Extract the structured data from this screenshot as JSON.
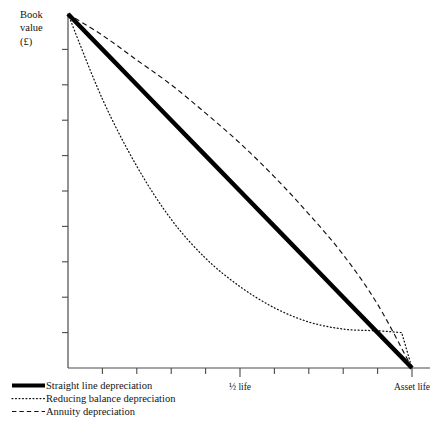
{
  "chart_data": {
    "type": "line",
    "title": "",
    "ylabel": "Book value (£)",
    "ylabel_lines": [
      "Book",
      "value",
      "(£)"
    ],
    "xlabel": "",
    "xlim": [
      0,
      1
    ],
    "ylim": [
      0,
      1
    ],
    "grid": false,
    "legend_position": "below-axes-left",
    "x_tick_count": 10,
    "y_tick_count": 9,
    "x_tick_labels": [
      {
        "x": 0.5,
        "label": "½ life"
      },
      {
        "x": 1.0,
        "label": "Asset life"
      }
    ],
    "y_tick_labels": [],
    "series": [
      {
        "name": "Straight line depreciation",
        "style": "solid-thick",
        "x": [
          0,
          0.1,
          0.2,
          0.3,
          0.4,
          0.5,
          0.6,
          0.7,
          0.8,
          0.9,
          1.0
        ],
        "values": [
          1.0,
          0.9,
          0.8,
          0.7,
          0.6,
          0.5,
          0.4,
          0.3,
          0.2,
          0.1,
          0.0
        ]
      },
      {
        "name": "Reducing balance depreciation",
        "style": "dotted",
        "x": [
          0,
          0.1,
          0.2,
          0.3,
          0.4,
          0.5,
          0.6,
          0.7,
          0.8,
          0.9,
          0.97,
          1.0
        ],
        "values": [
          1.0,
          0.76,
          0.57,
          0.42,
          0.31,
          0.23,
          0.17,
          0.13,
          0.11,
          0.105,
          0.1,
          0.0
        ]
      },
      {
        "name": "Annuity depreciation",
        "style": "dashed",
        "x": [
          0,
          0.1,
          0.2,
          0.3,
          0.4,
          0.5,
          0.6,
          0.7,
          0.8,
          0.9,
          1.0
        ],
        "values": [
          1.0,
          0.94,
          0.87,
          0.8,
          0.72,
          0.635,
          0.54,
          0.435,
          0.32,
          0.18,
          0.0
        ]
      }
    ]
  },
  "legend": {
    "items": [
      {
        "label": "Straight line depreciation",
        "style": "solid-thick"
      },
      {
        "label": "Reducing balance depreciation",
        "style": "dotted"
      },
      {
        "label": "Annuity depreciation",
        "style": "dashed"
      }
    ]
  },
  "colors": {
    "ink": "#111111",
    "axis": "#4a4a4a",
    "background": "#ffffff"
  }
}
